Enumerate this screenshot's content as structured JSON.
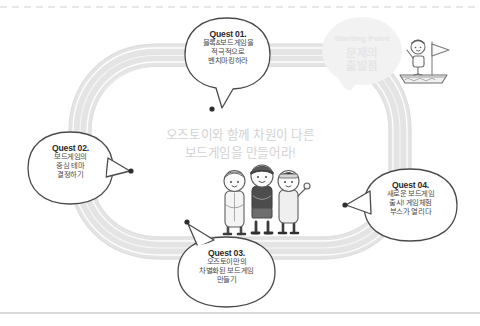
{
  "canvas": {
    "width": 480,
    "height": 326,
    "background": "#ffffff"
  },
  "rules": {
    "top_divider": "dashed",
    "bottom_divider": "solid",
    "divider_color": "#b9b9b9"
  },
  "center_message": {
    "name": "center-slogan",
    "lines": [
      "오즈토이와 함께 차원이 다른",
      "보드게임을 만들어라!"
    ],
    "color": "#d2d2d2"
  },
  "starting_point": {
    "name": "starting-point-badge",
    "label_en": "Starting Point",
    "label_kr_line1": "문제의",
    "label_kr_line2": "출발점",
    "badge_color": "#f2f2f2",
    "text_color": "#e5e5e5"
  },
  "track": {
    "name": "race-track-loop",
    "fill": "#ececec",
    "lane_line_color": "#ffffff",
    "outline_color": "#dcdcdc"
  },
  "quests": [
    {
      "id": "quest-01",
      "title": "Quest 01.",
      "lines": [
        "블록&보드게임을",
        "적극적으로",
        "벤치마킹하라"
      ],
      "tail_direction": "down"
    },
    {
      "id": "quest-02",
      "title": "Quest 02.",
      "lines": [
        "보드게임의",
        "중심 테마",
        "결정하기"
      ],
      "tail_direction": "right"
    },
    {
      "id": "quest-03",
      "title": "Quest 03.",
      "lines": [
        "오즈토이만의",
        "차별화된 보드게임",
        "만들기"
      ],
      "tail_direction": "up"
    },
    {
      "id": "quest-04",
      "title": "Quest 04.",
      "lines": [
        "새로운 보드게임",
        "출시! 게임체험",
        "부스가 열리다"
      ],
      "tail_direction": "left"
    }
  ],
  "characters": {
    "name": "character-group",
    "figures": [
      {
        "id": "character-left",
        "description": "light-jacket-boy"
      },
      {
        "id": "character-center",
        "description": "beanie-boy"
      },
      {
        "id": "character-right",
        "description": "headband-girl-waving"
      }
    ]
  },
  "flag_figure": {
    "name": "flag-bearer-on-boat",
    "description": "person waving on boat with flag"
  }
}
